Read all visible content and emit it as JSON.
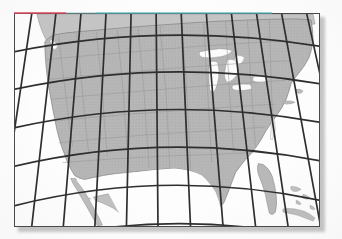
{
  "figure": {
    "kind": "map-figure",
    "caption": "",
    "page_background": "#fdfdfd",
    "plate": {
      "x": 14,
      "y": 13,
      "width": 306,
      "height": 214,
      "border_color": "#4a4a4a",
      "background": "#fefefe",
      "shadow_color": "#9a9a9a"
    }
  },
  "map_data": {
    "type": "thematic-reference-map",
    "region": "North America (contiguous United States)",
    "projection": "conic",
    "projection_note": "Meridians converge toward the top; parallels are arcs concave toward the top pole.",
    "colors": {
      "land": "#b5b5b5",
      "land_highlight": "#c2c2c2",
      "water": "#fdfdfd",
      "coastline": "#7d7d7d",
      "state_border": "#949494",
      "graticule": "#2e2e2e",
      "neighbor_land": "#c6c6c6",
      "frame": "#4a4a4a"
    },
    "graticule": {
      "visible": true,
      "line_color": "#2e2e2e",
      "line_width": 1.7,
      "meridian_count": 13,
      "parallel_count": 6,
      "meridian_spacing_degrees": 5,
      "parallel_spacing_degrees": 5,
      "longitude_range": [
        -125,
        -65
      ],
      "latitude_range": [
        25,
        50
      ],
      "labels_shown": false
    },
    "features_visible": [
      "Pacific coastline",
      "Baja California peninsula",
      "Gulf of California",
      "Great Lakes",
      "Lake Michigan",
      "Lake Huron",
      "Lake Superior",
      "Lake Erie",
      "Lake Ontario",
      "Florida peninsula",
      "Gulf of Mexico",
      "Atlantic coastline",
      "Cuba",
      "Bahamas",
      "Texas Gulf Coast",
      "Chesapeake Bay",
      "Cape Cod",
      "Long Island",
      "Puget Sound",
      "state boundaries",
      "southern Canada",
      "northern Mexico"
    ],
    "scan_artifacts": {
      "chromatic_fringe_top_left": "#d94a5c",
      "chromatic_fringe_top_right": "#4fb8bd",
      "drop_shadow": true
    }
  }
}
